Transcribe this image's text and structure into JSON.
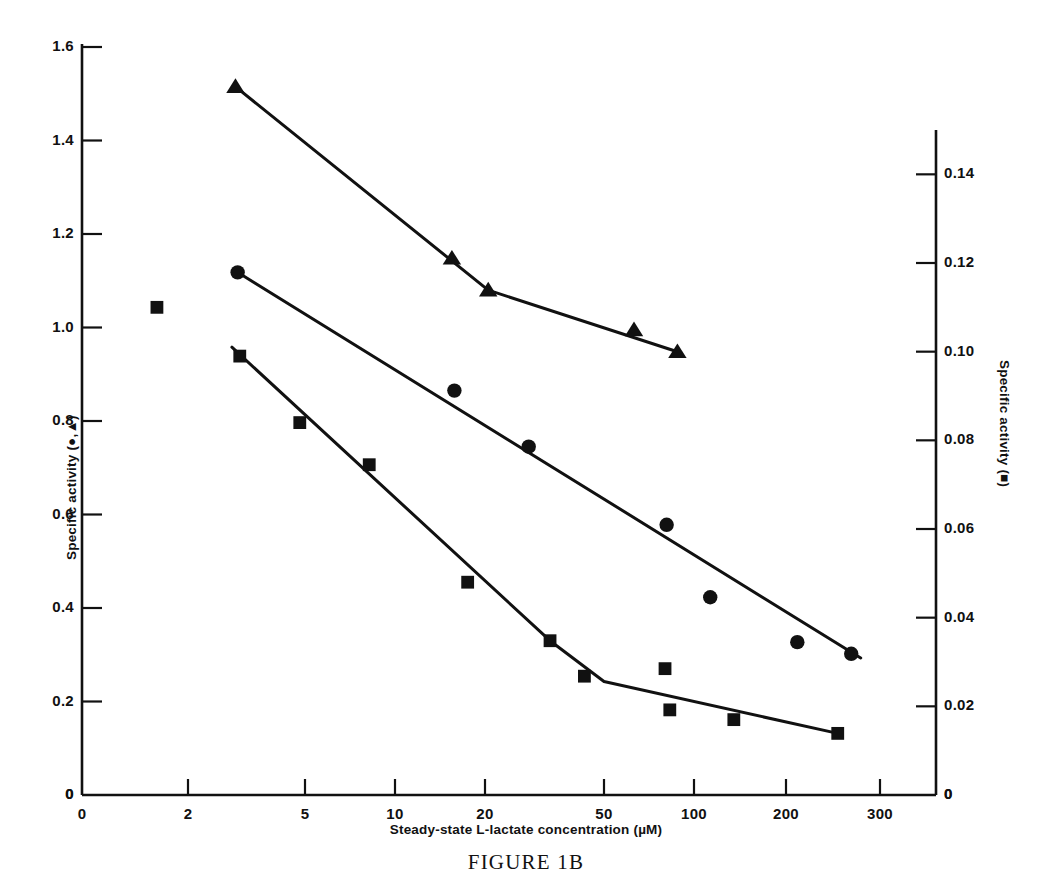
{
  "figure": {
    "caption": "FIGURE 1B",
    "background": "#ffffff",
    "ink_color": "#111111"
  },
  "chart_data": {
    "type": "line",
    "title": "",
    "subtitle": "",
    "xlabel": "Steady-state L-lactate concentration (µM)",
    "ylabel": "Specific activity (●,▲)",
    "ylabel_right": "Specific activity (■)",
    "xscale": "log",
    "xlim": [
      1.0,
      420
    ],
    "xticks": [
      0,
      2,
      5,
      10,
      20,
      50,
      100,
      200,
      300
    ],
    "xticklabels": [
      "0",
      "2",
      "5",
      "10",
      "20",
      "50",
      "100",
      "200",
      "300"
    ],
    "ylim": [
      0,
      1.63
    ],
    "yticks": [
      0,
      0.2,
      0.4,
      0.6,
      0.8,
      1.0,
      1.2,
      1.4,
      1.6
    ],
    "yticklabels": [
      "0",
      "0.2",
      "0.4",
      "0.6",
      "0.8",
      "1.0",
      "1.2",
      "1.4",
      "1.6"
    ],
    "ylim_right": [
      0,
      0.153
    ],
    "yticks_right": [
      0,
      0.02,
      0.04,
      0.06,
      0.08,
      0.1,
      0.12,
      0.14
    ],
    "yticklabels_right": [
      "0",
      "0.02",
      "0.04",
      "0.06",
      "0.08",
      "0.10",
      "0.12",
      "0.14"
    ],
    "grid": false,
    "legend": "none",
    "series": [
      {
        "name": "triangle-series",
        "marker": "triangle",
        "axis": "left",
        "points": [
          {
            "x": 2.9,
            "y": 1.515
          },
          {
            "x": 15.5,
            "y": 1.148
          },
          {
            "x": 20.5,
            "y": 1.08
          },
          {
            "x": 63.0,
            "y": 0.995
          },
          {
            "x": 88.0,
            "y": 0.948
          }
        ],
        "line": [
          {
            "x": 2.9,
            "y": 1.515
          },
          {
            "x": 20.5,
            "y": 1.08
          },
          {
            "x": 88.0,
            "y": 0.948
          }
        ]
      },
      {
        "name": "circle-series",
        "marker": "circle",
        "axis": "left",
        "points": [
          {
            "x": 2.95,
            "y": 1.118
          },
          {
            "x": 15.8,
            "y": 0.865
          },
          {
            "x": 28.0,
            "y": 0.745
          },
          {
            "x": 81.0,
            "y": 0.578
          },
          {
            "x": 113.0,
            "y": 0.423
          },
          {
            "x": 210.0,
            "y": 0.327
          },
          {
            "x": 265.0,
            "y": 0.302
          }
        ],
        "line": [
          {
            "x": 2.95,
            "y": 1.118
          },
          {
            "x": 276.0,
            "y": 0.293
          }
        ]
      },
      {
        "name": "square-series",
        "marker": "square",
        "axis": "right",
        "points": [
          {
            "x": 1.2,
            "y": 0.11
          },
          {
            "x": 3.0,
            "y": 0.099
          },
          {
            "x": 4.8,
            "y": 0.084
          },
          {
            "x": 8.2,
            "y": 0.0745
          },
          {
            "x": 17.5,
            "y": 0.048
          },
          {
            "x": 33.0,
            "y": 0.0348
          },
          {
            "x": 43.0,
            "y": 0.0268
          },
          {
            "x": 80.0,
            "y": 0.0285
          },
          {
            "x": 83.0,
            "y": 0.0192
          },
          {
            "x": 135.0,
            "y": 0.017
          },
          {
            "x": 250.0,
            "y": 0.0139
          }
        ],
        "line": [
          {
            "x": 2.82,
            "y": 0.101
          },
          {
            "x": 33.0,
            "y": 0.0348
          },
          {
            "x": 50.0,
            "y": 0.0256
          },
          {
            "x": 250.0,
            "y": 0.0139
          }
        ]
      }
    ]
  }
}
